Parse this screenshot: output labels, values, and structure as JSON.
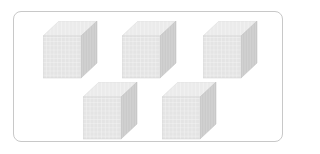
{
  "figure": {
    "cube_count": 5,
    "rows": [
      3,
      2
    ],
    "cube_label": "thousand-cube",
    "grid_divisions": 10
  },
  "colors": {
    "frame_border": "#c8c8c8",
    "front_face": "#e6e6e6",
    "top_face": "#ededed",
    "side_face": "#c9c9c9",
    "grid_line_light": "#ffffff",
    "grid_line_dark": "#b5b5b5"
  },
  "cubes": [
    {
      "x": 43,
      "y": 21
    },
    {
      "x": 122,
      "y": 21
    },
    {
      "x": 203,
      "y": 21
    },
    {
      "x": 83,
      "y": 82
    },
    {
      "x": 162,
      "y": 82
    }
  ]
}
